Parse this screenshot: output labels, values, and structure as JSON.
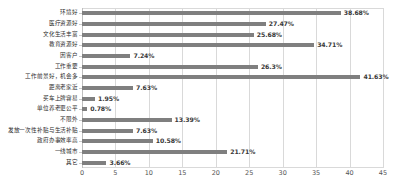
{
  "chart_data": {
    "type": "bar",
    "orientation": "horizontal",
    "title": "",
    "subtitle": "",
    "xlabel": "",
    "ylabel": "",
    "xlim": [
      0,
      45
    ],
    "xticks": [
      0,
      5,
      10,
      15,
      20,
      25,
      30,
      35,
      40,
      45
    ],
    "grid": true,
    "legend": false,
    "value_suffix": "%",
    "bar_color": "#7f7f7f",
    "grid_color": "#d9d9d9",
    "text_color": "#2b2b2b",
    "categories": [
      "环境好",
      "医疗资源好",
      "文化生活丰富",
      "教育资源好",
      "因客户",
      "工作重要",
      "工作前景好，机会多",
      "距离老家近",
      "买车上牌容易",
      "单位养老更公平",
      "不限外",
      "发放一次性补贴与生活补贴",
      "政府办事效率高",
      "一线城市",
      "其它"
    ],
    "values": [
      38.68,
      27.47,
      25.68,
      34.71,
      7.24,
      26.3,
      41.63,
      7.63,
      1.95,
      0.78,
      13.39,
      7.63,
      10.58,
      21.71,
      3.66
    ],
    "value_labels": [
      "38.68%",
      "27.47%",
      "25.68%",
      "34.71%",
      "7.24%",
      "26.3%",
      "41.63%",
      "7.63%",
      "1.95%",
      "0.78%",
      "13.39%",
      "7.63%",
      "10.58%",
      "21.71%",
      "3.66%"
    ]
  }
}
